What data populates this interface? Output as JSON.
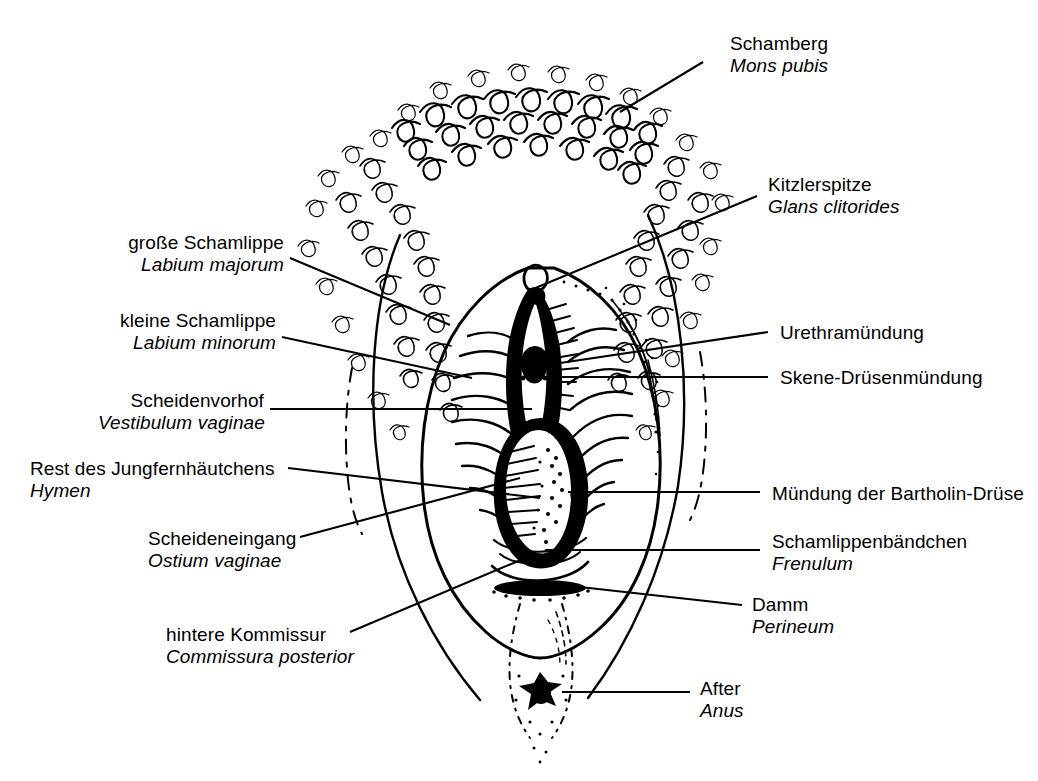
{
  "figure": {
    "style": "black-and-white line engraving",
    "ink_color": "#000000",
    "background_color": "#ffffff"
  },
  "labels": [
    {
      "id": "mons-pubis",
      "side": "right",
      "german": "Schamberg",
      "latin": "Mons pubis",
      "text_x": 730,
      "text_y": 33,
      "leader": [
        [
          703,
          62
        ],
        [
          620,
          112
        ]
      ]
    },
    {
      "id": "glans-clitoridis",
      "side": "right",
      "german": "Kitzlerspitze",
      "latin": "Glans clitorides",
      "text_x": 768,
      "text_y": 174,
      "leader": [
        [
          757,
          196
        ],
        [
          533,
          289
        ]
      ]
    },
    {
      "id": "urethral-opening",
      "side": "right",
      "german": "Urethramündung",
      "latin": "",
      "text_x": 780,
      "text_y": 322,
      "leader": [
        [
          768,
          332
        ],
        [
          540,
          366
        ]
      ]
    },
    {
      "id": "skene-glands",
      "side": "right",
      "german": "Skene-Drüsenmündung",
      "latin": "",
      "text_x": 780,
      "text_y": 367,
      "leader": [
        [
          768,
          377
        ],
        [
          534,
          377
        ]
      ]
    },
    {
      "id": "bartholin-gland",
      "side": "right",
      "german": "Mündung der Bartholin-Drüse",
      "latin": "",
      "text_x": 772,
      "text_y": 483,
      "leader": [
        [
          760,
          492
        ],
        [
          568,
          492
        ]
      ]
    },
    {
      "id": "frenulum",
      "side": "right",
      "german": "Schamlippenbändchen",
      "latin": "Frenulum",
      "text_x": 772,
      "text_y": 531,
      "leader": [
        [
          760,
          550
        ],
        [
          545,
          550
        ]
      ]
    },
    {
      "id": "perineum",
      "side": "right",
      "german": "Damm",
      "latin": "Perineum",
      "text_x": 752,
      "text_y": 594,
      "leader": [
        [
          742,
          605
        ],
        [
          553,
          584
        ]
      ]
    },
    {
      "id": "anus",
      "side": "right",
      "german": "After",
      "latin": "Anus",
      "text_x": 700,
      "text_y": 678,
      "leader": [
        [
          690,
          692
        ],
        [
          562,
          692
        ]
      ]
    },
    {
      "id": "labium-majus",
      "side": "left",
      "german": "große Schamlippe",
      "latin": "Labium majorum",
      "text_x": 128,
      "text_y": 232,
      "leader": [
        [
          290,
          258
        ],
        [
          450,
          325
        ]
      ]
    },
    {
      "id": "labium-minus",
      "side": "left",
      "german": "kleine Schamlippe",
      "latin": "Labium minorum",
      "text_x": 128,
      "text_y": 310,
      "leader": [
        [
          282,
          337
        ],
        [
          472,
          378
        ]
      ]
    },
    {
      "id": "vestibulum",
      "side": "left",
      "german": "Scheidenvorhof",
      "latin": "Vestibulum vaginae",
      "text_x": 108,
      "text_y": 390,
      "leader": [
        [
          270,
          409
        ],
        [
          532,
          409
        ]
      ]
    },
    {
      "id": "hymen",
      "side": "left",
      "german": "Rest des Jungfernhäutchens",
      "latin": "Hymen",
      "text_x": 30,
      "text_y": 458,
      "leader": [
        [
          288,
          468
        ],
        [
          540,
          498
        ]
      ]
    },
    {
      "id": "ostium-vaginae",
      "side": "left",
      "german": "Scheideneingang",
      "latin": "Ostium vaginae",
      "text_x": 148,
      "text_y": 528,
      "leader": [
        [
          300,
          537
        ],
        [
          520,
          478
        ]
      ]
    },
    {
      "id": "commissura-posterior",
      "side": "left",
      "german": "hintere Kommissur",
      "latin": "Commissura posterior",
      "text_x": 166,
      "text_y": 624,
      "leader": [
        [
          350,
          632
        ],
        [
          530,
          556
        ]
      ]
    }
  ]
}
